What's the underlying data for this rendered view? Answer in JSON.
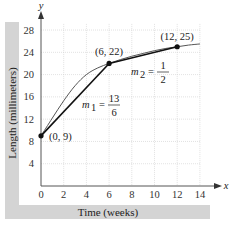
{
  "chart_data": {
    "type": "line",
    "title": "",
    "xlabel": "Time (weeks)",
    "ylabel": "Length (millimeters)",
    "x_axis_letter": "x",
    "y_axis_letter": "y",
    "xlim": [
      0,
      15
    ],
    "ylim": [
      0,
      30
    ],
    "xticks": [
      0,
      2,
      4,
      6,
      8,
      10,
      12,
      14
    ],
    "yticks": [
      4,
      8,
      12,
      16,
      20,
      24,
      28
    ],
    "grid": true,
    "curve": {
      "name": "growth-curve",
      "x": [
        0,
        1,
        2,
        3,
        4,
        5,
        6,
        7,
        8,
        9,
        10,
        11,
        12,
        13,
        14
      ],
      "y": [
        9,
        12.2,
        15.3,
        18,
        20,
        21.2,
        22,
        22.7,
        23.3,
        23.8,
        24.3,
        24.7,
        25,
        25.3,
        25.5
      ]
    },
    "points": [
      {
        "x": 0,
        "y": 9,
        "label": "(0, 9)"
      },
      {
        "x": 6,
        "y": 22,
        "label": "(6, 22)"
      },
      {
        "x": 12,
        "y": 25,
        "label": "(12, 25)"
      }
    ],
    "secants": [
      {
        "from": [
          0,
          9
        ],
        "to": [
          6,
          22
        ],
        "slope_name": "m",
        "slope_sub": "1",
        "numerator": "13",
        "denominator": "6"
      },
      {
        "from": [
          6,
          22
        ],
        "to": [
          12,
          25
        ],
        "slope_name": "m",
        "slope_sub": "2",
        "numerator": "1",
        "denominator": "2"
      }
    ]
  }
}
